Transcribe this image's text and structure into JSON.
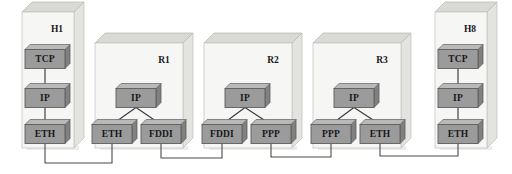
{
  "diagram": {
    "background_color": "#ffffff",
    "node_fill_color": "#9b9b9b",
    "panel_fill_color": "#f6f6f4",
    "line_color": "#3a3a3a",
    "panels": [
      {
        "id": "H1",
        "label": "H1",
        "kind": "host",
        "x": 22,
        "y": 12,
        "w": 52,
        "h": 136,
        "depth": 10,
        "label_x": 57,
        "label_y": 30,
        "nodes": [
          {
            "id": "h1-tcp",
            "label": "TCP",
            "cx": 45,
            "cy": 59,
            "w": 40,
            "h": 19
          },
          {
            "id": "h1-ip",
            "label": "IP",
            "cx": 45,
            "cy": 98,
            "w": 40,
            "h": 19
          },
          {
            "id": "h1-eth",
            "label": "ETH",
            "cx": 45,
            "cy": 134,
            "w": 40,
            "h": 19
          }
        ],
        "internal_links": [
          {
            "from": "h1-tcp",
            "to": "h1-ip"
          },
          {
            "from": "h1-ip",
            "to": "h1-eth"
          }
        ]
      },
      {
        "id": "R1",
        "label": "R1",
        "kind": "router",
        "x": 95,
        "y": 43,
        "w": 88,
        "h": 105,
        "depth": 10,
        "label_x": 164,
        "label_y": 61,
        "nodes": [
          {
            "id": "r1-ip",
            "label": "IP",
            "cx": 136,
            "cy": 98,
            "w": 40,
            "h": 19
          },
          {
            "id": "r1-eth",
            "label": "ETH",
            "cx": 112,
            "cy": 134,
            "w": 40,
            "h": 19
          },
          {
            "id": "r1-fddi",
            "label": "FDDI",
            "cx": 161,
            "cy": 134,
            "w": 40,
            "h": 19
          }
        ],
        "internal_links": [
          {
            "from": "r1-ip",
            "to": "r1-eth"
          },
          {
            "from": "r1-ip",
            "to": "r1-fddi"
          }
        ]
      },
      {
        "id": "R2",
        "label": "R2",
        "kind": "router",
        "x": 204,
        "y": 43,
        "w": 88,
        "h": 105,
        "depth": 10,
        "label_x": 273,
        "label_y": 61,
        "nodes": [
          {
            "id": "r2-ip",
            "label": "IP",
            "cx": 245,
            "cy": 98,
            "w": 40,
            "h": 19
          },
          {
            "id": "r2-fddi",
            "label": "FDDI",
            "cx": 222,
            "cy": 134,
            "w": 40,
            "h": 19
          },
          {
            "id": "r2-ppp",
            "label": "PPP",
            "cx": 271,
            "cy": 134,
            "w": 40,
            "h": 19
          }
        ],
        "internal_links": [
          {
            "from": "r2-ip",
            "to": "r2-fddi"
          },
          {
            "from": "r2-ip",
            "to": "r2-ppp"
          }
        ]
      },
      {
        "id": "R3",
        "label": "R3",
        "kind": "router",
        "x": 313,
        "y": 43,
        "w": 88,
        "h": 105,
        "depth": 10,
        "label_x": 382,
        "label_y": 61,
        "nodes": [
          {
            "id": "r3-ip",
            "label": "IP",
            "cx": 354,
            "cy": 98,
            "w": 40,
            "h": 19
          },
          {
            "id": "r3-ppp",
            "label": "PPP",
            "cx": 331,
            "cy": 134,
            "w": 40,
            "h": 19
          },
          {
            "id": "r3-eth",
            "label": "ETH",
            "cx": 380,
            "cy": 134,
            "w": 40,
            "h": 19
          }
        ],
        "internal_links": [
          {
            "from": "r3-ip",
            "to": "r3-ppp"
          },
          {
            "from": "r3-ip",
            "to": "r3-eth"
          }
        ]
      },
      {
        "id": "H8",
        "label": "H8",
        "kind": "host",
        "x": 435,
        "y": 12,
        "w": 52,
        "h": 136,
        "depth": 10,
        "label_x": 470,
        "label_y": 30,
        "nodes": [
          {
            "id": "h8-tcp",
            "label": "TCP",
            "cx": 458,
            "cy": 59,
            "w": 40,
            "h": 19
          },
          {
            "id": "h8-ip",
            "label": "IP",
            "cx": 458,
            "cy": 98,
            "w": 40,
            "h": 19
          },
          {
            "id": "h8-eth",
            "label": "ETH",
            "cx": 458,
            "cy": 134,
            "w": 40,
            "h": 19
          }
        ],
        "internal_links": [
          {
            "from": "h8-tcp",
            "to": "h8-ip"
          },
          {
            "from": "h8-ip",
            "to": "h8-eth"
          }
        ]
      }
    ],
    "external_links": [
      {
        "id": "wire-h1-r1",
        "from": "h1-eth",
        "to": "r1-eth",
        "label": "",
        "bus_y": 163
      },
      {
        "id": "wire-r1-r2",
        "from": "r1-fddi",
        "to": "r2-fddi",
        "label": "",
        "bus_y": 158
      },
      {
        "id": "wire-r2-r3",
        "from": "r2-ppp",
        "to": "r3-ppp",
        "label": "",
        "bus_y": 157
      },
      {
        "id": "wire-r3-h8",
        "from": "r3-eth",
        "to": "h8-eth",
        "label": "",
        "bus_y": 156
      }
    ]
  }
}
